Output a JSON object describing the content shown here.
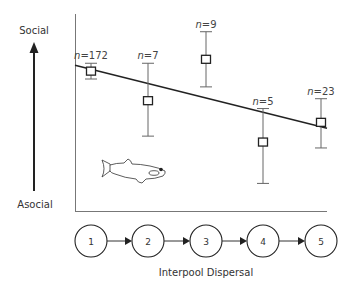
{
  "chart_data": {
    "type": "scatter",
    "title": "",
    "xlabel": "Interpool Dispersal",
    "ylabel_top": "Social",
    "ylabel_bottom": "Asocial",
    "ylim": [
      0,
      100
    ],
    "categories": [
      "1",
      "2",
      "3",
      "4",
      "5"
    ],
    "points": [
      {
        "x": "1",
        "n_label": "n=172",
        "n": 172,
        "mean": 71,
        "err_low": 67,
        "err_high": 75
      },
      {
        "x": "2",
        "n_label": "n=7",
        "n": 7,
        "mean": 56,
        "err_low": 38,
        "err_high": 75
      },
      {
        "x": "3",
        "n_label": "n=9",
        "n": 9,
        "mean": 77,
        "err_low": 63,
        "err_high": 91
      },
      {
        "x": "4",
        "n_label": "n=5",
        "n": 5,
        "mean": 35,
        "err_low": 14,
        "err_high": 52
      },
      {
        "x": "5",
        "n_label": "n=23",
        "n": 23,
        "mean": 45,
        "err_low": 32,
        "err_high": 57
      }
    ],
    "trend_line": {
      "start_value": 74,
      "end_value": 42
    },
    "grid": false,
    "legend": "none",
    "annotations": [
      "fish illustration (guppy)"
    ],
    "node_flow": [
      "1",
      "2",
      "3",
      "4",
      "5"
    ]
  }
}
